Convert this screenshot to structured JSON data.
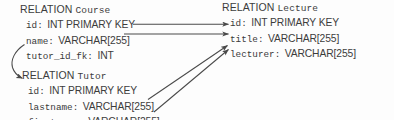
{
  "diagram": {
    "keyword": "RELATION",
    "ink_color": "#3b3b3b",
    "background_color": "#fdfdfd"
  },
  "relations": [
    {
      "id": "course",
      "name": "Course",
      "fields": [
        {
          "name": "id:",
          "type": "INT PRIMARY KEY"
        },
        {
          "name": "name:",
          "type": "VARCHAR[255]"
        },
        {
          "name": "tutor_id_fk:",
          "type": "INT"
        }
      ]
    },
    {
      "id": "lecture",
      "name": "Lecture",
      "fields": [
        {
          "name": "id:",
          "type": "INT PRIMARY KEY"
        },
        {
          "name": "title:",
          "type": "VARCHAR[255]"
        },
        {
          "name": "lecturer:",
          "type": "VARCHAR[255]"
        }
      ]
    },
    {
      "id": "tutor",
      "name": "Tutor",
      "fields": [
        {
          "name": "id:",
          "type": "INT PRIMARY KEY"
        },
        {
          "name": "lastname:",
          "type": "VARCHAR[255]"
        },
        {
          "name": "firstname:",
          "type": "VARCHAR[255]"
        }
      ]
    }
  ],
  "connectors": [
    {
      "id": "course-id-to-lecture-id",
      "from": "Course.id",
      "to": "Lecture.id",
      "style": "straight-arrow"
    },
    {
      "id": "course-name-to-lecture-title",
      "from": "Course.name",
      "to": "Lecture.title",
      "style": "straight-arrow"
    },
    {
      "id": "course-tutorfk-to-tutor-id",
      "from": "Course.tutor_id_fk",
      "to": "Tutor.id",
      "style": "curved-arrow"
    },
    {
      "id": "tutor-lastname-to-lecture-lecturer",
      "from": "Tutor.lastname",
      "to": "Lecture.lecturer",
      "style": "diagonal-arrow"
    },
    {
      "id": "tutor-firstname-to-lecture-lecturer",
      "from": "Tutor.firstname",
      "to": "Lecture.lecturer",
      "style": "diagonal-arrow"
    }
  ]
}
